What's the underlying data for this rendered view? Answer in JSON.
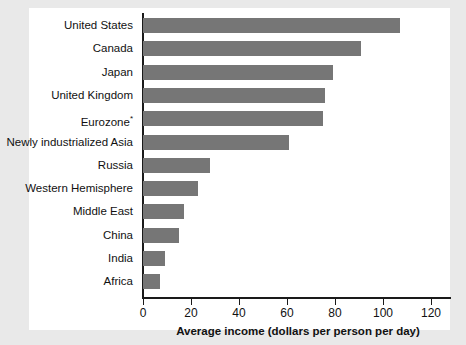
{
  "chart_data": {
    "type": "bar",
    "orientation": "horizontal",
    "title": "",
    "xlabel": "Average income (dollars per person per day)",
    "ylabel": "",
    "xlim": [
      0,
      130
    ],
    "xticks": [
      0,
      20,
      40,
      60,
      80,
      100,
      120
    ],
    "xtick_labels": [
      "0",
      "20",
      "40",
      "60",
      "80",
      "100",
      "120"
    ],
    "grid": false,
    "legend": false,
    "bar_color": "#767676",
    "categories": [
      "United States",
      "Canada",
      "Japan",
      "United Kingdom",
      "Eurozone*",
      "Newly industrialized Asia",
      "Russia",
      "Western Hemisphere",
      "Middle East",
      "China",
      "India",
      "Africa"
    ],
    "values": [
      107,
      91,
      79,
      76,
      75,
      61,
      28,
      23,
      17,
      15,
      9,
      7
    ],
    "series": [
      {
        "name": "Average income (dollars per person per day)",
        "values": [
          107,
          91,
          79,
          76,
          75,
          61,
          28,
          23,
          17,
          15,
          9,
          7
        ]
      }
    ],
    "bars": [
      {
        "label": "United States",
        "label_text": "United States",
        "has_asterisk": false,
        "value": 107
      },
      {
        "label": "Canada",
        "label_text": "Canada",
        "has_asterisk": false,
        "value": 91
      },
      {
        "label": "Japan",
        "label_text": "Japan",
        "has_asterisk": false,
        "value": 79
      },
      {
        "label": "United Kingdom",
        "label_text": "United Kingdom",
        "has_asterisk": false,
        "value": 76
      },
      {
        "label": "Eurozone*",
        "label_text": "Eurozone",
        "has_asterisk": true,
        "value": 75
      },
      {
        "label": "Newly industrialized Asia",
        "label_text": "Newly industrialized Asia",
        "has_asterisk": false,
        "value": 61
      },
      {
        "label": "Russia",
        "label_text": "Russia",
        "has_asterisk": false,
        "value": 28
      },
      {
        "label": "Western Hemisphere",
        "label_text": "Western Hemisphere",
        "has_asterisk": false,
        "value": 23
      },
      {
        "label": "Middle East",
        "label_text": "Middle East",
        "has_asterisk": false,
        "value": 17
      },
      {
        "label": "China",
        "label_text": "China",
        "has_asterisk": false,
        "value": 15
      },
      {
        "label": "India",
        "label_text": "India",
        "has_asterisk": false,
        "value": 9
      },
      {
        "label": "Africa",
        "label_text": "Africa",
        "has_asterisk": false,
        "value": 7
      }
    ]
  },
  "figure": {
    "background_color": "#e9e9e9",
    "panel_color": "#ffffff",
    "axis_color": "#1a1a1a"
  }
}
